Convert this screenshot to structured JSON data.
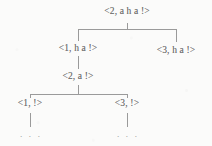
{
  "figure": {
    "kind": "derivation-tree",
    "background_color": "#fbfbfa",
    "line_color": "#9a9a9a",
    "text_color": "#6e6e6e",
    "width": 212,
    "height": 146,
    "ellipsis_glyph": ". . ."
  },
  "nodes": {
    "root": {
      "label": "<2, a h a !>",
      "x": 127,
      "y": 12
    },
    "left_child": {
      "label": "<1, h a !>",
      "x": 78,
      "y": 49
    },
    "right_child": {
      "label": "<3, h a !>",
      "x": 176,
      "y": 51
    },
    "middle": {
      "label": "<2, a !>",
      "x": 78,
      "y": 77
    },
    "leaf_left": {
      "label": "<1, !>",
      "x": 30,
      "y": 104
    },
    "leaf_right": {
      "label": "<3, !>",
      "x": 127,
      "y": 104
    }
  },
  "continuations": {
    "under_leaf_left": ". . .",
    "under_leaf_right": ". . ."
  }
}
